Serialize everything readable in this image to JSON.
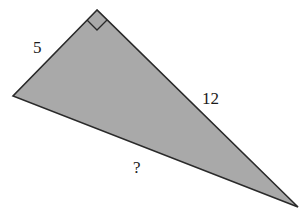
{
  "diagram": {
    "type": "right-triangle",
    "fill_color": "#a9a9a9",
    "stroke_color": "#2a2a2a",
    "vertices": {
      "right_angle": [
        97,
        10
      ],
      "left": [
        13,
        96
      ],
      "bottom_right": [
        298,
        207
      ]
    },
    "labels": {
      "short_leg": "5",
      "long_leg": "12",
      "hypotenuse": "?"
    }
  }
}
